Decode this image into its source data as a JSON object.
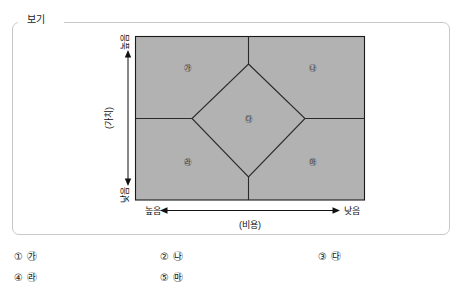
{
  "box": {
    "tab_label": "보기"
  },
  "diagram": {
    "type": "positioning-map",
    "y_axis": {
      "title": "(가치)",
      "high_label": "높음",
      "low_label": "낮음"
    },
    "x_axis": {
      "title": "(비용)",
      "left_label": "높음",
      "right_label": "낮음"
    },
    "fill_color": "#b2b2b2",
    "line_color": "#1a1a1a",
    "regions": [
      {
        "id": "ga",
        "label": "㉮",
        "position": "top-left"
      },
      {
        "id": "na",
        "label": "㉯",
        "position": "top-right"
      },
      {
        "id": "da",
        "label": "㉰",
        "position": "center-diamond"
      },
      {
        "id": "ra",
        "label": "㉱",
        "position": "bottom-left"
      },
      {
        "id": "ma",
        "label": "㉲",
        "position": "bottom-right"
      }
    ]
  },
  "choices": [
    {
      "number": "①",
      "value": "㉮"
    },
    {
      "number": "②",
      "value": "㉯"
    },
    {
      "number": "③",
      "value": "㉰"
    },
    {
      "number": "④",
      "value": "㉱"
    },
    {
      "number": "⑤",
      "value": "㉲"
    }
  ]
}
